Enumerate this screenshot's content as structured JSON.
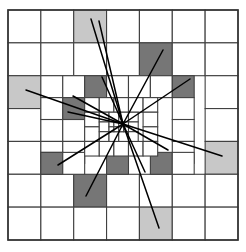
{
  "diagram": {
    "type": "quadtree-mesh",
    "width": 246,
    "height": 252
  },
  "colors": {
    "background": "#ffffff",
    "cell_fill_empty": "#ffffff",
    "cell_fill_light": "#c8c8c8",
    "cell_fill_dark": "#767676",
    "grid_stroke": "#404040",
    "border_stroke": "#333333",
    "ray_stroke": "#000000"
  },
  "geometry": {
    "grid_origin_x": 8,
    "grid_origin_y": 10,
    "grid_span": 230,
    "grid_stroke_width": 1.1,
    "border_stroke_width": 1.6,
    "ray_stroke_width": 1.5,
    "convergence_x": 123,
    "convergence_y": 124
  },
  "legend": {
    "empty_label": "unrefined cell",
    "light_label": "marked cell (light)",
    "dark_label": "marked cell (dark)",
    "ray_label": "ray path"
  },
  "cells": [
    {
      "id": "c000",
      "x": 8,
      "y": 10,
      "w": 32.857,
      "h": 32.857,
      "fill": "empty",
      "level": 1
    },
    {
      "id": "c001",
      "x": 40.857,
      "y": 10,
      "w": 32.857,
      "h": 32.857,
      "fill": "empty",
      "level": 1
    },
    {
      "id": "c002",
      "x": 73.714,
      "y": 10,
      "w": 32.857,
      "h": 32.857,
      "fill": "light",
      "level": 1
    },
    {
      "id": "c003",
      "x": 106.571,
      "y": 10,
      "w": 32.857,
      "h": 32.857,
      "fill": "empty",
      "level": 1
    },
    {
      "id": "c004",
      "x": 139.428,
      "y": 10,
      "w": 32.857,
      "h": 32.857,
      "fill": "empty",
      "level": 1
    },
    {
      "id": "c005",
      "x": 172.285,
      "y": 10,
      "w": 32.857,
      "h": 32.857,
      "fill": "empty",
      "level": 1
    },
    {
      "id": "c006",
      "x": 205.142,
      "y": 10,
      "w": 32.857,
      "h": 32.857,
      "fill": "empty",
      "level": 1
    },
    {
      "id": "c010",
      "x": 8,
      "y": 42.857,
      "w": 32.857,
      "h": 32.857,
      "fill": "empty",
      "level": 1
    },
    {
      "id": "c011",
      "x": 40.857,
      "y": 42.857,
      "w": 32.857,
      "h": 32.857,
      "fill": "empty",
      "level": 1
    },
    {
      "id": "c012",
      "x": 73.714,
      "y": 42.857,
      "w": 32.857,
      "h": 32.857,
      "fill": "empty",
      "level": 1
    },
    {
      "id": "c013",
      "x": 106.571,
      "y": 42.857,
      "w": 32.857,
      "h": 32.857,
      "fill": "empty",
      "level": 1
    },
    {
      "id": "c014",
      "x": 139.428,
      "y": 42.857,
      "w": 32.857,
      "h": 32.857,
      "fill": "dark",
      "level": 1
    },
    {
      "id": "c015",
      "x": 172.285,
      "y": 42.857,
      "w": 32.857,
      "h": 32.857,
      "fill": "empty",
      "level": 1
    },
    {
      "id": "c016",
      "x": 205.142,
      "y": 42.857,
      "w": 32.857,
      "h": 32.857,
      "fill": "empty",
      "level": 1
    },
    {
      "id": "c020",
      "x": 8,
      "y": 75.714,
      "w": 32.857,
      "h": 32.857,
      "fill": "light",
      "level": 1
    },
    {
      "id": "c026",
      "x": 205.142,
      "y": 75.714,
      "w": 32.857,
      "h": 32.857,
      "fill": "empty",
      "level": 1
    },
    {
      "id": "c030",
      "x": 8,
      "y": 108.571,
      "w": 32.857,
      "h": 32.857,
      "fill": "empty",
      "level": 1
    },
    {
      "id": "c036",
      "x": 205.142,
      "y": 108.571,
      "w": 32.857,
      "h": 32.857,
      "fill": "empty",
      "level": 1
    },
    {
      "id": "c040",
      "x": 8,
      "y": 141.428,
      "w": 32.857,
      "h": 32.857,
      "fill": "empty",
      "level": 1
    },
    {
      "id": "c046",
      "x": 205.142,
      "y": 141.428,
      "w": 32.857,
      "h": 32.857,
      "fill": "light",
      "level": 1
    },
    {
      "id": "c050",
      "x": 8,
      "y": 174.285,
      "w": 32.857,
      "h": 32.857,
      "fill": "empty",
      "level": 1
    },
    {
      "id": "c051",
      "x": 40.857,
      "y": 174.285,
      "w": 32.857,
      "h": 32.857,
      "fill": "empty",
      "level": 1
    },
    {
      "id": "c052",
      "x": 73.714,
      "y": 174.285,
      "w": 32.857,
      "h": 32.857,
      "fill": "dark",
      "level": 1
    },
    {
      "id": "c053",
      "x": 106.571,
      "y": 174.285,
      "w": 32.857,
      "h": 32.857,
      "fill": "empty",
      "level": 1
    },
    {
      "id": "c054",
      "x": 139.428,
      "y": 174.285,
      "w": 32.857,
      "h": 32.857,
      "fill": "empty",
      "level": 1
    },
    {
      "id": "c055",
      "x": 172.285,
      "y": 174.285,
      "w": 32.857,
      "h": 32.857,
      "fill": "empty",
      "level": 1
    },
    {
      "id": "c056",
      "x": 205.142,
      "y": 174.285,
      "w": 32.857,
      "h": 32.857,
      "fill": "empty",
      "level": 1
    },
    {
      "id": "c060",
      "x": 8,
      "y": 207.142,
      "w": 32.857,
      "h": 32.857,
      "fill": "empty",
      "level": 1
    },
    {
      "id": "c061",
      "x": 40.857,
      "y": 207.142,
      "w": 32.857,
      "h": 32.857,
      "fill": "empty",
      "level": 1
    },
    {
      "id": "c062",
      "x": 73.714,
      "y": 207.142,
      "w": 32.857,
      "h": 32.857,
      "fill": "empty",
      "level": 1
    },
    {
      "id": "c063",
      "x": 106.571,
      "y": 207.142,
      "w": 32.857,
      "h": 32.857,
      "fill": "empty",
      "level": 1
    },
    {
      "id": "c064",
      "x": 139.428,
      "y": 207.142,
      "w": 32.857,
      "h": 32.857,
      "fill": "light",
      "level": 1
    },
    {
      "id": "c065",
      "x": 172.285,
      "y": 207.142,
      "w": 32.857,
      "h": 32.857,
      "fill": "empty",
      "level": 1
    },
    {
      "id": "c066",
      "x": 205.142,
      "y": 207.142,
      "w": 32.857,
      "h": 32.857,
      "fill": "empty",
      "level": 1
    },
    {
      "id": "m00",
      "x": 40.857,
      "y": 75.714,
      "w": 21.904,
      "h": 21.904,
      "fill": "empty",
      "level": 2
    },
    {
      "id": "m01",
      "x": 62.761,
      "y": 75.714,
      "w": 21.904,
      "h": 21.904,
      "fill": "empty",
      "level": 2
    },
    {
      "id": "m02",
      "x": 84.666,
      "y": 75.714,
      "w": 21.904,
      "h": 21.904,
      "fill": "dark",
      "level": 2
    },
    {
      "id": "m03",
      "x": 106.571,
      "y": 75.714,
      "w": 21.904,
      "h": 21.904,
      "fill": "empty",
      "level": 2
    },
    {
      "id": "m04",
      "x": 128.476,
      "y": 75.714,
      "w": 21.904,
      "h": 21.904,
      "fill": "empty",
      "level": 2
    },
    {
      "id": "m05",
      "x": 150.38,
      "y": 75.714,
      "w": 21.904,
      "h": 21.904,
      "fill": "empty",
      "level": 2
    },
    {
      "id": "m06",
      "x": 172.285,
      "y": 75.714,
      "w": 21.904,
      "h": 21.904,
      "fill": "dark",
      "level": 2
    },
    {
      "id": "m10",
      "x": 40.857,
      "y": 97.619,
      "w": 21.904,
      "h": 21.904,
      "fill": "empty",
      "level": 2
    },
    {
      "id": "m11",
      "x": 62.761,
      "y": 97.619,
      "w": 21.904,
      "h": 21.904,
      "fill": "dark",
      "level": 2
    },
    {
      "id": "m16",
      "x": 172.285,
      "y": 97.619,
      "w": 21.904,
      "h": 21.904,
      "fill": "empty",
      "level": 2
    },
    {
      "id": "m20",
      "x": 40.857,
      "y": 119.523,
      "w": 21.904,
      "h": 21.904,
      "fill": "empty",
      "level": 2
    },
    {
      "id": "m21",
      "x": 62.761,
      "y": 119.523,
      "w": 21.904,
      "h": 21.904,
      "fill": "empty",
      "level": 2
    },
    {
      "id": "m26",
      "x": 172.285,
      "y": 119.523,
      "w": 21.904,
      "h": 21.904,
      "fill": "empty",
      "level": 2
    },
    {
      "id": "m30",
      "x": 40.857,
      "y": 141.428,
      "w": 21.904,
      "h": 21.904,
      "fill": "empty",
      "level": 2
    },
    {
      "id": "m31",
      "x": 62.761,
      "y": 141.428,
      "w": 21.904,
      "h": 21.904,
      "fill": "empty",
      "level": 2
    },
    {
      "id": "m36",
      "x": 172.285,
      "y": 141.428,
      "w": 21.904,
      "h": 21.904,
      "fill": "empty",
      "level": 2
    },
    {
      "id": "m40",
      "x": 40.857,
      "y": 152.38,
      "w": 21.904,
      "h": 21.904,
      "fill": "empty",
      "level": 2
    },
    {
      "id": "m41",
      "x": 40.857,
      "y": 152.38,
      "w": 21.904,
      "h": 21.904,
      "fill": "dark",
      "level": 2
    },
    {
      "id": "m42",
      "x": 62.761,
      "y": 152.38,
      "w": 21.904,
      "h": 21.904,
      "fill": "empty",
      "level": 2
    },
    {
      "id": "m43",
      "x": 150.38,
      "y": 152.38,
      "w": 21.904,
      "h": 21.904,
      "fill": "dark",
      "level": 2
    },
    {
      "id": "m44",
      "x": 172.285,
      "y": 152.38,
      "w": 21.904,
      "h": 21.904,
      "fill": "empty",
      "level": 2
    },
    {
      "id": "m50",
      "x": 106.571,
      "y": 152.38,
      "w": 21.904,
      "h": 21.904,
      "fill": "dark",
      "level": 2
    },
    {
      "id": "f00",
      "x": 84.666,
      "y": 97.619,
      "w": 14.603,
      "h": 14.603,
      "fill": "empty",
      "level": 3
    },
    {
      "id": "f01",
      "x": 99.269,
      "y": 97.619,
      "w": 14.603,
      "h": 14.603,
      "fill": "empty",
      "level": 3
    },
    {
      "id": "f02",
      "x": 113.873,
      "y": 97.619,
      "w": 14.603,
      "h": 14.603,
      "fill": "empty",
      "level": 3
    },
    {
      "id": "f03",
      "x": 128.476,
      "y": 97.619,
      "w": 14.603,
      "h": 14.603,
      "fill": "empty",
      "level": 3
    },
    {
      "id": "f04",
      "x": 143.079,
      "y": 97.619,
      "w": 14.603,
      "h": 14.603,
      "fill": "empty",
      "level": 3
    },
    {
      "id": "f10",
      "x": 84.666,
      "y": 112.222,
      "w": 14.603,
      "h": 14.603,
      "fill": "empty",
      "level": 3
    },
    {
      "id": "f14",
      "x": 143.079,
      "y": 112.222,
      "w": 14.603,
      "h": 14.603,
      "fill": "empty",
      "level": 3
    },
    {
      "id": "f20",
      "x": 84.666,
      "y": 126.825,
      "w": 14.603,
      "h": 14.603,
      "fill": "empty",
      "level": 3
    },
    {
      "id": "f24",
      "x": 143.079,
      "y": 126.825,
      "w": 14.603,
      "h": 14.603,
      "fill": "empty",
      "level": 3
    },
    {
      "id": "f30",
      "x": 84.666,
      "y": 141.428,
      "w": 14.603,
      "h": 14.603,
      "fill": "empty",
      "level": 3
    },
    {
      "id": "f31",
      "x": 99.269,
      "y": 141.428,
      "w": 14.603,
      "h": 14.603,
      "fill": "empty",
      "level": 3
    },
    {
      "id": "f32",
      "x": 113.873,
      "y": 141.428,
      "w": 14.603,
      "h": 14.603,
      "fill": "empty",
      "level": 3
    },
    {
      "id": "f33",
      "x": 128.476,
      "y": 141.428,
      "w": 14.603,
      "h": 14.603,
      "fill": "empty",
      "level": 3
    },
    {
      "id": "f34",
      "x": 143.079,
      "y": 141.428,
      "w": 14.603,
      "h": 14.603,
      "fill": "empty",
      "level": 3
    },
    {
      "id": "g00",
      "x": 99.269,
      "y": 112.222,
      "w": 9.735,
      "h": 9.735,
      "fill": "empty",
      "level": 4
    },
    {
      "id": "g01",
      "x": 109.004,
      "y": 112.222,
      "w": 9.735,
      "h": 9.735,
      "fill": "empty",
      "level": 4
    },
    {
      "id": "g02",
      "x": 118.739,
      "y": 112.222,
      "w": 9.735,
      "h": 9.735,
      "fill": "empty",
      "level": 4
    },
    {
      "id": "g03",
      "x": 128.476,
      "y": 112.222,
      "w": 9.735,
      "h": 9.735,
      "fill": "empty",
      "level": 4
    },
    {
      "id": "g10",
      "x": 99.269,
      "y": 121.957,
      "w": 9.735,
      "h": 9.735,
      "fill": "empty",
      "level": 4
    },
    {
      "id": "g13",
      "x": 128.476,
      "y": 121.957,
      "w": 9.735,
      "h": 9.735,
      "fill": "empty",
      "level": 4
    },
    {
      "id": "g20",
      "x": 99.269,
      "y": 131.693,
      "w": 9.735,
      "h": 9.735,
      "fill": "empty",
      "level": 4
    },
    {
      "id": "g21",
      "x": 109.004,
      "y": 131.693,
      "w": 9.735,
      "h": 9.735,
      "fill": "empty",
      "level": 4
    },
    {
      "id": "g22",
      "x": 118.739,
      "y": 131.693,
      "w": 9.735,
      "h": 9.735,
      "fill": "empty",
      "level": 4
    },
    {
      "id": "g23",
      "x": 128.476,
      "y": 131.693,
      "w": 9.735,
      "h": 9.735,
      "fill": "empty",
      "level": 4
    },
    {
      "id": "h00",
      "x": 109.004,
      "y": 121.957,
      "w": 4.867,
      "h": 4.867,
      "fill": "empty",
      "level": 5
    },
    {
      "id": "h01",
      "x": 113.871,
      "y": 121.957,
      "w": 4.867,
      "h": 4.867,
      "fill": "empty",
      "level": 5
    },
    {
      "id": "h02",
      "x": 118.739,
      "y": 121.957,
      "w": 4.867,
      "h": 4.867,
      "fill": "empty",
      "level": 5
    },
    {
      "id": "h03",
      "x": 123.606,
      "y": 121.957,
      "w": 4.867,
      "h": 4.867,
      "fill": "empty",
      "level": 5
    },
    {
      "id": "h10",
      "x": 109.004,
      "y": 126.825,
      "w": 4.867,
      "h": 4.867,
      "fill": "empty",
      "level": 5
    },
    {
      "id": "h11",
      "x": 113.871,
      "y": 126.825,
      "w": 4.867,
      "h": 4.867,
      "fill": "empty",
      "level": 5
    },
    {
      "id": "h12",
      "x": 118.739,
      "y": 126.825,
      "w": 4.867,
      "h": 4.867,
      "fill": "empty",
      "level": 5
    },
    {
      "id": "h13",
      "x": 123.606,
      "y": 126.825,
      "w": 4.867,
      "h": 4.867,
      "fill": "empty",
      "level": 5
    }
  ],
  "rays": [
    {
      "id": "r01",
      "x1": 123,
      "y1": 124,
      "x2": 91,
      "y2": 19
    },
    {
      "id": "r02",
      "x1": 123,
      "y1": 124,
      "x2": 99,
      "y2": 21
    },
    {
      "id": "r03",
      "x1": 123,
      "y1": 124,
      "x2": 163,
      "y2": 50
    },
    {
      "id": "r04",
      "x1": 123,
      "y1": 124,
      "x2": 102,
      "y2": 77
    },
    {
      "id": "r05",
      "x1": 123,
      "y1": 124,
      "x2": 190,
      "y2": 79
    },
    {
      "id": "r06",
      "x1": 123,
      "y1": 124,
      "x2": 26,
      "y2": 90
    },
    {
      "id": "r07",
      "x1": 123,
      "y1": 124,
      "x2": 73,
      "y2": 96
    },
    {
      "id": "r08",
      "x1": 123,
      "y1": 124,
      "x2": 68,
      "y2": 112
    },
    {
      "id": "r09",
      "x1": 123,
      "y1": 124,
      "x2": 222,
      "y2": 156
    },
    {
      "id": "r10",
      "x1": 123,
      "y1": 124,
      "x2": 168,
      "y2": 150
    },
    {
      "id": "r11",
      "x1": 123,
      "y1": 124,
      "x2": 58,
      "y2": 165
    },
    {
      "id": "r12",
      "x1": 123,
      "y1": 124,
      "x2": 145,
      "y2": 172
    },
    {
      "id": "r13",
      "x1": 123,
      "y1": 124,
      "x2": 86,
      "y2": 196
    },
    {
      "id": "r14",
      "x1": 123,
      "y1": 124,
      "x2": 159,
      "y2": 228
    }
  ]
}
